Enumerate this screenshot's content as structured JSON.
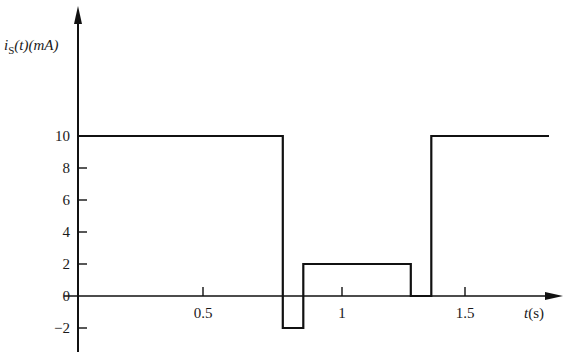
{
  "chart_data": {
    "type": "line",
    "subtype": "step",
    "title": "",
    "xlabel": "t(s)",
    "ylabel": "i_S(t)(mA)",
    "ylabel_parts": {
      "base": "i",
      "sub": "S",
      "rest": "(t)(mA)"
    },
    "xlabel_parts": {
      "var": "t",
      "unit": "(s)"
    },
    "xlim": [
      0,
      1.9
    ],
    "ylim": [
      -3,
      17
    ],
    "xticks": [
      0.5,
      1,
      1.5
    ],
    "xtick_labels": [
      "0.5",
      "1",
      "1.5"
    ],
    "yticks": [
      -2,
      0,
      2,
      4,
      6,
      8,
      10
    ],
    "ytick_labels": [
      "−2",
      "0",
      "2",
      "4",
      "6",
      "8",
      "10"
    ],
    "grid": false,
    "legend": null,
    "series": [
      {
        "name": "i_S(t)",
        "color": "#111111",
        "points": [
          [
            0,
            10
          ],
          [
            0.8,
            10
          ],
          [
            0.8,
            -2
          ],
          [
            0.88,
            -2
          ],
          [
            0.88,
            2
          ],
          [
            1.3,
            2
          ],
          [
            1.3,
            0
          ],
          [
            1.38,
            0
          ],
          [
            1.38,
            10
          ],
          [
            1.84,
            10
          ]
        ]
      }
    ],
    "segments": [
      {
        "t_start": 0,
        "t_end": 0.8,
        "value": 10
      },
      {
        "t_start": 0.8,
        "t_end": 0.88,
        "value": -2
      },
      {
        "t_start": 0.88,
        "t_end": 1.3,
        "value": 2
      },
      {
        "t_start": 1.3,
        "t_end": 1.38,
        "value": 0
      },
      {
        "t_start": 1.38,
        "t_end": 1.84,
        "value": 10
      }
    ]
  }
}
